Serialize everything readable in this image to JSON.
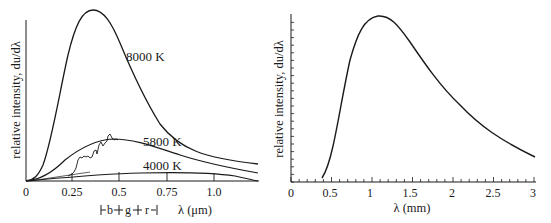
{
  "chart_data": [
    {
      "type": "line",
      "title": "",
      "xlabel": "λ (μm)",
      "ylabel": "relative intensity, du/dλ",
      "xlim": [
        0,
        1.2
      ],
      "x_ticks": [
        "0",
        "0.25",
        "0.5",
        "0.75",
        "1.0"
      ],
      "grid": false,
      "series": [
        {
          "name": "8000 K",
          "x": [
            0.05,
            0.1,
            0.15,
            0.2,
            0.25,
            0.3,
            0.36,
            0.42,
            0.5,
            0.6,
            0.7,
            0.8,
            0.9,
            1.0,
            1.1,
            1.2
          ],
          "values": [
            0.5,
            8,
            30,
            58,
            82,
            96,
            100,
            96,
            82,
            63,
            46,
            34,
            25,
            19,
            14,
            11
          ]
        },
        {
          "name": "5800 K",
          "x": [
            0.05,
            0.1,
            0.2,
            0.3,
            0.4,
            0.5,
            0.6,
            0.7,
            0.8,
            0.9,
            1.0,
            1.1,
            1.2
          ],
          "values": [
            0,
            1,
            8,
            17,
            23,
            24,
            22,
            19,
            16,
            13,
            10,
            8,
            6
          ]
        },
        {
          "name": "4000 K",
          "x": [
            0.05,
            0.2,
            0.4,
            0.6,
            0.72,
            0.9,
            1.0,
            1.1,
            1.2
          ],
          "values": [
            0,
            1,
            3,
            4,
            4.3,
            4,
            3.5,
            2.5,
            1
          ]
        },
        {
          "name": "solar spectrum (measured)",
          "x": [
            0.25,
            0.3,
            0.35,
            0.4,
            0.45,
            0.5
          ],
          "values": [
            3,
            13,
            14,
            22,
            25,
            23
          ]
        }
      ],
      "annotations": [
        "8000 K",
        "5800 K",
        "4000 K"
      ],
      "band_markers": [
        "b",
        "g",
        "r"
      ]
    },
    {
      "type": "line",
      "title": "",
      "xlabel": "λ (mm)",
      "ylabel": "relative intensity, du/dλ",
      "xlim": [
        0,
        3
      ],
      "x_ticks": [
        "0",
        "0.5",
        "1",
        "1.5",
        "2",
        "2.5",
        "3"
      ],
      "grid": false,
      "series": [
        {
          "name": "spectrum",
          "x": [
            0.4,
            0.5,
            0.6,
            0.7,
            0.8,
            0.9,
            1.0,
            1.1,
            1.2,
            1.4,
            1.6,
            1.8,
            2.0,
            2.2,
            2.5,
            2.8,
            3.0
          ],
          "values": [
            2,
            12,
            35,
            62,
            83,
            95,
            99.5,
            100,
            97,
            85,
            69,
            56,
            45,
            37,
            28,
            21,
            18
          ]
        }
      ]
    }
  ],
  "left_chart": {
    "ylabel": "relative intensity, du/dλ",
    "xlabel": "λ (μm)",
    "ticks": [
      "0",
      "0.25",
      "0.5",
      "0.75",
      "1.0"
    ],
    "curve_labels": [
      "8000 K",
      "5800 K",
      "4000 K"
    ],
    "bands": [
      "b",
      "g",
      "r"
    ]
  },
  "right_chart": {
    "ylabel": "relative intensity, du/dλ",
    "xlabel": "λ (mm)",
    "ticks": [
      "0",
      "0.5",
      "1",
      "1.5",
      "2",
      "2.5",
      "3"
    ]
  }
}
